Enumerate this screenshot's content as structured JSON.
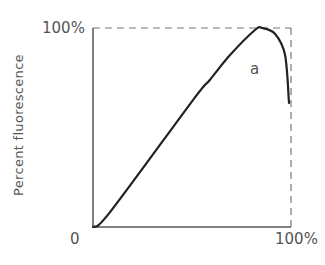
{
  "chart_data": {
    "type": "line",
    "title": "",
    "xlabel": "",
    "ylabel": "Percent fluorescence",
    "xlim": [
      0,
      100
    ],
    "ylim": [
      0,
      100
    ],
    "x_tick_labels": [
      "0",
      "100%"
    ],
    "y_tick_labels": [
      "100%"
    ],
    "grid": false,
    "legend": null,
    "reference_lines": [
      {
        "type": "horizontal",
        "y": 100,
        "style": "dashed"
      },
      {
        "type": "vertical",
        "x": 100,
        "style": "dashed"
      }
    ],
    "series": [
      {
        "name": "a",
        "x": [
          0,
          8.6,
          50.5,
          59,
          69.2,
          81.8,
          85.4,
          92,
          97,
          99
        ],
        "y": [
          0,
          7.5,
          63.8,
          73.9,
          86.4,
          99,
          100,
          97,
          86.4,
          62.3
        ]
      }
    ],
    "annotations": [
      {
        "text": "a",
        "x": 80,
        "y": 80
      }
    ]
  },
  "labels": {
    "ylabel": "Percent fluorescence",
    "y_top": "100%",
    "origin": "0",
    "x_right": "100%",
    "curve": "a"
  },
  "colors": {
    "curve": "#222222",
    "axis": "#555555",
    "dashed": "#777777",
    "text": "#555555"
  }
}
